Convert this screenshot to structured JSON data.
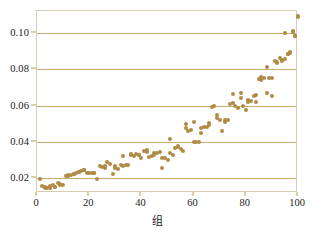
{
  "chart_data": {
    "type": "scatter",
    "title": "",
    "xlabel": "组",
    "ylabel": "",
    "xlim": [
      0,
      100
    ],
    "ylim": [
      0.012,
      0.112
    ],
    "grid": "horizontal",
    "legend": "none",
    "marker_color": "#b08b45",
    "grid_color": "#bb9d57",
    "frame_color": "#d8cdb4",
    "xticks": [
      0,
      20,
      40,
      60,
      80,
      100
    ],
    "xtick_labels": [
      "0",
      "20",
      "40",
      "60",
      "80",
      "100"
    ],
    "yticks": [
      0.02,
      0.04,
      0.06,
      0.08,
      0.1
    ],
    "ytick_labels": [
      "0.02",
      "0.04",
      "0.06",
      "0.08",
      "0.10"
    ],
    "n_points": 140,
    "x": [
      1,
      2,
      3,
      4,
      5,
      6,
      7,
      8,
      9,
      10,
      11,
      12,
      13,
      14,
      15,
      16,
      17,
      18,
      19,
      20,
      21,
      22,
      23,
      24,
      25,
      26,
      27,
      28,
      29,
      30,
      31,
      32,
      33,
      34,
      35,
      36,
      37,
      38,
      39,
      40,
      41,
      42,
      43,
      44,
      45,
      46,
      47,
      48,
      49,
      50,
      51,
      52,
      53,
      54,
      55,
      56,
      57,
      58,
      59,
      60,
      61,
      62,
      63,
      64,
      65,
      66,
      67,
      68,
      69,
      70,
      71,
      72,
      73,
      74,
      75,
      76,
      77,
      78,
      79,
      80,
      81,
      82,
      83,
      84,
      85,
      86,
      87,
      88,
      89,
      90,
      91,
      92,
      93,
      94,
      95,
      96,
      97,
      98,
      99,
      100,
      3,
      5,
      7,
      9,
      12,
      14,
      16,
      18,
      22,
      26,
      30,
      33,
      36,
      39,
      42,
      45,
      48,
      51,
      54,
      57,
      60,
      63,
      66,
      69,
      72,
      75,
      78,
      81,
      84,
      86,
      88,
      90,
      92,
      94,
      95,
      96,
      97,
      98,
      99,
      100
    ],
    "y": [
      0.0197,
      0.0158,
      0.0152,
      0.015,
      0.0157,
      0.0162,
      0.0155,
      0.0175,
      0.0172,
      0.0163,
      0.0212,
      0.0215,
      0.022,
      0.0222,
      0.0228,
      0.0238,
      0.0242,
      0.0248,
      0.0232,
      0.0228,
      0.0232,
      0.023,
      0.0199,
      0.0268,
      0.0262,
      0.0256,
      0.0288,
      0.0282,
      0.0222,
      0.0258,
      0.0252,
      0.0272,
      0.027,
      0.0275,
      0.0276,
      0.033,
      0.0325,
      0.0332,
      0.033,
      0.0315,
      0.0352,
      0.0348,
      0.0318,
      0.0322,
      0.034,
      0.0338,
      0.0345,
      0.0258,
      0.031,
      0.03,
      0.034,
      0.033,
      0.0368,
      0.0372,
      0.0362,
      0.0352,
      0.0475,
      0.0462,
      0.0468,
      0.0402,
      0.0402,
      0.04,
      0.0478,
      0.048,
      0.0482,
      0.0492,
      0.059,
      0.06,
      0.053,
      0.0522,
      0.0462,
      0.051,
      0.052,
      0.061,
      0.0612,
      0.06,
      0.0588,
      0.064,
      0.06,
      0.0575,
      0.0618,
      0.0625,
      0.0655,
      0.066,
      0.0745,
      0.0742,
      0.0752,
      0.0668,
      0.075,
      0.0652,
      0.0845,
      0.0832,
      0.0862,
      0.0852,
      0.0998,
      0.0882,
      0.0888,
      0.1008,
      0.0982,
      0.109,
      0.0148,
      0.015,
      0.0152,
      0.0166,
      0.0218,
      0.0226,
      0.0235,
      0.0245,
      0.023,
      0.0268,
      0.0268,
      0.0322,
      0.0332,
      0.033,
      0.0358,
      0.033,
      0.031,
      0.0418,
      0.038,
      0.05,
      0.0508,
      0.045,
      0.0505,
      0.0548,
      0.052,
      0.0665,
      0.0668,
      0.0632,
      0.062,
      0.0755,
      0.081,
      0.0752,
      0.0838,
      0.0848,
      0.0855,
      0.0885,
      0.0892,
      0.1005,
      0.0985,
      0.1088
    ]
  }
}
